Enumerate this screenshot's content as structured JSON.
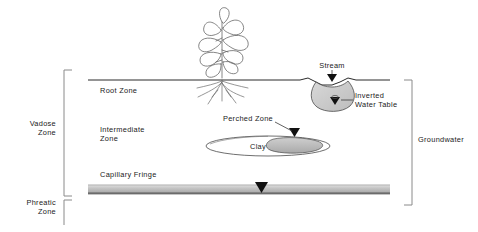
{
  "diagram": {
    "background_color": "#ffffff",
    "line_color": "#2b2b2b",
    "bracket_color": "#8a8a8a",
    "text_color": "#1a1a1a",
    "fringe_color": "#b9b9b9",
    "stream_fill_color": "#cfcfcf"
  },
  "left_brackets": [
    {
      "id": "vadose",
      "label_line1": "Vadose",
      "label_line2": "Zone"
    },
    {
      "id": "phreatic",
      "label_line1": "Phreatic",
      "label_line2": "Zone"
    }
  ],
  "right_brackets": [
    {
      "id": "groundwater",
      "label": "Groundwater"
    }
  ],
  "zone_labels": [
    {
      "id": "root-zone",
      "label": "Root  Zone"
    },
    {
      "id": "intermediate-zone",
      "label_line1": "Intermediate",
      "label_line2": "Zone"
    },
    {
      "id": "capillary-fringe",
      "label": "Capillary  Fringe"
    }
  ],
  "features": [
    {
      "id": "stream",
      "label": "Stream"
    },
    {
      "id": "inverted-water-table",
      "label_line1": "Inverted",
      "label_line2": "Water Table"
    },
    {
      "id": "perched-zone",
      "label": "Perched  Zone"
    },
    {
      "id": "clay-lens",
      "label": "Clay"
    }
  ],
  "markers": [
    {
      "id": "stream-surface-marker",
      "shape": "down-triangle"
    },
    {
      "id": "inverted-water-table-marker",
      "shape": "down-triangle"
    },
    {
      "id": "perched-water-table-marker",
      "shape": "down-triangle"
    },
    {
      "id": "water-table-marker",
      "shape": "down-triangle"
    }
  ],
  "illustration": {
    "plant": "leafy-plant-with-roots"
  }
}
